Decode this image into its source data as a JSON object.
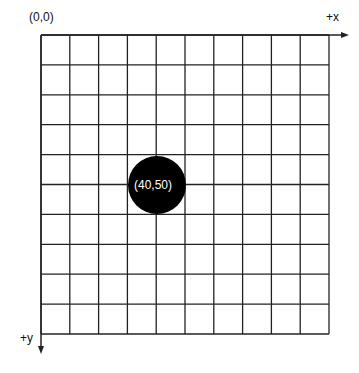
{
  "diagram": {
    "origin_label": "(0,0)",
    "x_axis_label": "+x",
    "y_axis_label": "+y",
    "grid": {
      "columns": 10,
      "rows": 10
    },
    "point": {
      "label": "(40,50)",
      "color": "#000000",
      "label_color": "#ffffff"
    }
  }
}
